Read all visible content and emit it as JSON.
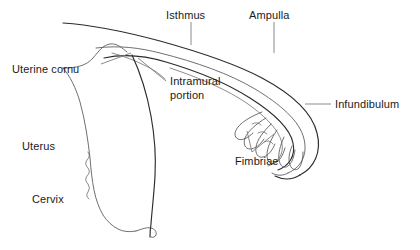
{
  "diagram": {
    "background_color": "#ffffff",
    "stroke_color": "#2b2b2b",
    "leader_color": "#7d7d7d"
  },
  "labels": {
    "isthmus": "Isthmus",
    "ampulla": "Ampulla",
    "uterine_cornu": "Uterine cornu",
    "intramural_line1": "Intramural",
    "intramural_line2": "portion",
    "infundibulum": "Infundibulum",
    "fimbriae": "Fimbriae",
    "uterus": "Uterus",
    "cervix": "Cervix"
  },
  "structures": [
    {
      "name": "uterine-tube-outer-wall",
      "label": "Isthmus"
    },
    {
      "name": "uterine-tube-lumen",
      "label": "Ampulla"
    },
    {
      "name": "uterine-cornu",
      "label": "Uterine cornu"
    },
    {
      "name": "intramural-portion",
      "label": "Intramural portion"
    },
    {
      "name": "infundibulum",
      "label": "Infundibulum"
    },
    {
      "name": "fimbriae",
      "label": "Fimbriae"
    },
    {
      "name": "uterus-body",
      "label": "Uterus"
    },
    {
      "name": "cervix",
      "label": "Cervix"
    }
  ]
}
